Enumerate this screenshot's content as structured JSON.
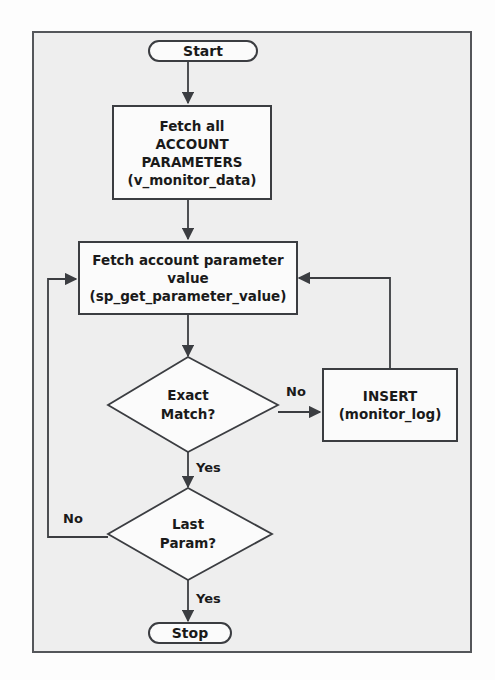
{
  "diagram": {
    "type": "flowchart",
    "colors": {
      "frame_fill": "#eeeeee",
      "frame_stroke": "#54565a",
      "node_fill": "#fbfbfb",
      "node_stroke": "#3b3d41",
      "text": "#1a1a1a",
      "page_background": "#fdfdfd"
    },
    "nodes": [
      {
        "id": "start",
        "shape": "terminator",
        "label": "Start",
        "lines": [
          "Start"
        ]
      },
      {
        "id": "fetch_all",
        "shape": "process",
        "label": "Fetch all ACCOUNT PARAMETERS (v_monitor_data)",
        "lines": [
          "Fetch all",
          "ACCOUNT",
          "PARAMETERS",
          "(v_monitor_data)"
        ]
      },
      {
        "id": "fetch_value",
        "shape": "process",
        "label": "Fetch account parameter value (sp_get_parameter_value)",
        "lines": [
          "Fetch account parameter",
          "value",
          "(sp_get_parameter_value)"
        ]
      },
      {
        "id": "exact_match",
        "shape": "decision",
        "label": "Exact Match?",
        "lines": [
          "Exact",
          "Match?"
        ]
      },
      {
        "id": "insert_log",
        "shape": "process",
        "label": "INSERT (monitor_log)",
        "lines": [
          "INSERT",
          "(monitor_log)"
        ]
      },
      {
        "id": "last_param",
        "shape": "decision",
        "label": "Last Param?",
        "lines": [
          "Last",
          "Param?"
        ]
      },
      {
        "id": "stop",
        "shape": "terminator",
        "label": "Stop",
        "lines": [
          "Stop"
        ]
      }
    ],
    "edge_labels": {
      "exact_match_no": "No",
      "exact_match_yes": "Yes",
      "last_param_no": "No",
      "last_param_yes": "Yes"
    },
    "edges": [
      {
        "from": "start",
        "to": "fetch_all",
        "label": ""
      },
      {
        "from": "fetch_all",
        "to": "fetch_value",
        "label": ""
      },
      {
        "from": "fetch_value",
        "to": "exact_match",
        "label": ""
      },
      {
        "from": "exact_match",
        "to": "insert_log",
        "label": "No"
      },
      {
        "from": "insert_log",
        "to": "fetch_value",
        "label": ""
      },
      {
        "from": "exact_match",
        "to": "last_param",
        "label": "Yes"
      },
      {
        "from": "last_param",
        "to": "fetch_value",
        "label": "No"
      },
      {
        "from": "last_param",
        "to": "stop",
        "label": "Yes"
      }
    ]
  }
}
